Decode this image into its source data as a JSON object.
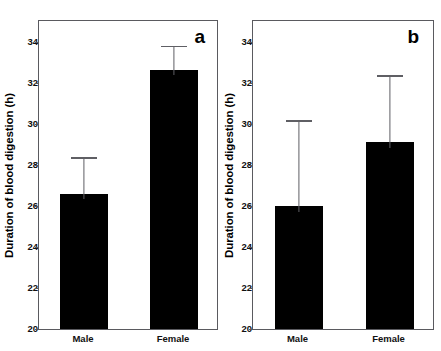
{
  "figure": {
    "panels": [
      {
        "letter": "a",
        "ylabel": "Duration of blood digestion (h)",
        "ytick_labels": [
          "20",
          "22",
          "24",
          "26",
          "28",
          "30",
          "32",
          "34"
        ],
        "xtick_labels": [
          "Male",
          "Female"
        ]
      },
      {
        "letter": "b",
        "ylabel": "Duration of blood digestion (h)",
        "ytick_labels": [
          "20",
          "22",
          "24",
          "26",
          "28",
          "30",
          "32",
          "34"
        ],
        "xtick_labels": [
          "Male",
          "Female"
        ]
      }
    ]
  },
  "chart_data": [
    {
      "type": "bar",
      "title": "a",
      "panel": "a",
      "categories": [
        "Male",
        "Female"
      ],
      "values": [
        26.6,
        32.65
      ],
      "error_upper": [
        1.75,
        1.15
      ],
      "error_bar_tops": [
        28.35,
        33.8
      ],
      "xlabel": "",
      "ylabel": "Duration of blood digestion (h)",
      "ylim": [
        20,
        35
      ],
      "yticks": [
        20,
        22,
        24,
        26,
        28,
        30,
        32,
        34
      ],
      "grid": false,
      "legend": "none",
      "bar_color": "#000000"
    },
    {
      "type": "bar",
      "title": "b",
      "panel": "b",
      "categories": [
        "Male",
        "Female"
      ],
      "values": [
        26.0,
        29.1
      ],
      "error_upper": [
        4.15,
        3.25
      ],
      "error_bar_tops": [
        30.15,
        32.35
      ],
      "xlabel": "",
      "ylabel": "Duration of blood digestion (h)",
      "ylim": [
        20,
        35
      ],
      "yticks": [
        20,
        22,
        24,
        26,
        28,
        30,
        32,
        34
      ],
      "grid": false,
      "legend": "none",
      "bar_color": "#000000"
    }
  ]
}
